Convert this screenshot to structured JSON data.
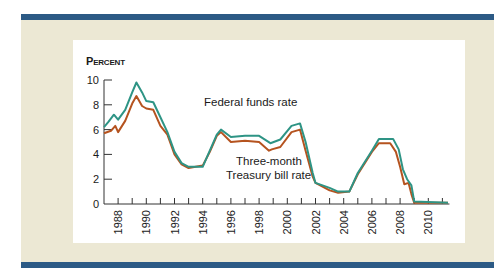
{
  "chart_data": {
    "type": "line",
    "title": "",
    "ylabel": "Percent",
    "xlabel": "",
    "ylim": [
      0,
      10
    ],
    "xlim": [
      1987,
      2011.5
    ],
    "y_ticks": [
      0,
      2,
      4,
      6,
      8,
      10
    ],
    "x_ticks": [
      "1988",
      "1990",
      "1992",
      "1994",
      "1996",
      "1998",
      "2000",
      "2002",
      "2004",
      "2006",
      "2008",
      "2010"
    ],
    "grid": false,
    "legend": "inline annotations",
    "annotations": [
      "Federal funds rate",
      "Three-month Treasury bill rate"
    ],
    "series": [
      {
        "name": "Federal funds rate",
        "color": "#2e9485",
        "x": [
          1987.0,
          1987.3,
          1987.7,
          1988.0,
          1988.5,
          1989.0,
          1989.3,
          1989.7,
          1990.0,
          1990.5,
          1991.0,
          1991.5,
          1992.0,
          1992.5,
          1993.0,
          1994.0,
          1994.5,
          1995.0,
          1995.3,
          1996.0,
          1997.0,
          1998.0,
          1998.8,
          1999.5,
          2000.3,
          2000.9,
          2001.3,
          2001.8,
          2002.0,
          2003.0,
          2003.6,
          2004.4,
          2005.0,
          2006.0,
          2006.5,
          2007.5,
          2007.9,
          2008.2,
          2008.5,
          2008.8,
          2009.0,
          2011.4
        ],
        "values": [
          6.2,
          6.6,
          7.2,
          6.8,
          7.6,
          9.0,
          9.8,
          9.0,
          8.3,
          8.2,
          7.0,
          5.8,
          4.2,
          3.3,
          3.0,
          3.0,
          4.3,
          5.6,
          6.0,
          5.4,
          5.5,
          5.5,
          4.9,
          5.2,
          6.3,
          6.5,
          5.0,
          2.5,
          1.7,
          1.3,
          1.0,
          1.0,
          2.5,
          4.3,
          5.25,
          5.25,
          4.4,
          2.8,
          2.0,
          1.5,
          0.2,
          0.1
        ]
      },
      {
        "name": "Three-month Treasury bill rate",
        "color": "#b5531f",
        "x": [
          1987.0,
          1987.5,
          1987.8,
          1988.0,
          1988.5,
          1989.0,
          1989.3,
          1989.7,
          1990.0,
          1990.5,
          1991.0,
          1991.5,
          1992.0,
          1992.5,
          1993.0,
          1994.0,
          1994.5,
          1995.0,
          1995.3,
          1996.0,
          1997.0,
          1998.0,
          1998.7,
          1998.9,
          1999.5,
          2000.3,
          2000.9,
          2001.3,
          2001.8,
          2002.0,
          2003.0,
          2003.6,
          2004.4,
          2005.0,
          2006.0,
          2006.5,
          2007.3,
          2007.7,
          2008.0,
          2008.3,
          2008.6,
          2008.8,
          2009.0,
          2011.4
        ],
        "values": [
          5.7,
          5.9,
          6.3,
          5.8,
          6.7,
          8.1,
          8.7,
          7.9,
          7.7,
          7.6,
          6.3,
          5.6,
          4.0,
          3.2,
          2.9,
          3.1,
          4.2,
          5.5,
          5.8,
          5.0,
          5.1,
          5.0,
          4.3,
          4.4,
          4.6,
          5.8,
          6.0,
          4.3,
          2.2,
          1.7,
          1.1,
          0.9,
          1.0,
          2.4,
          4.2,
          4.9,
          4.9,
          4.2,
          3.0,
          1.6,
          1.7,
          0.8,
          0.1,
          0.1
        ]
      }
    ]
  },
  "chart": {
    "ylabel_first": "P",
    "ylabel_rest": "ERCENT",
    "annotation_fed": "Federal funds rate",
    "annotation_tbill_line1": "Three-month",
    "annotation_tbill_line2": "Treasury bill rate"
  }
}
